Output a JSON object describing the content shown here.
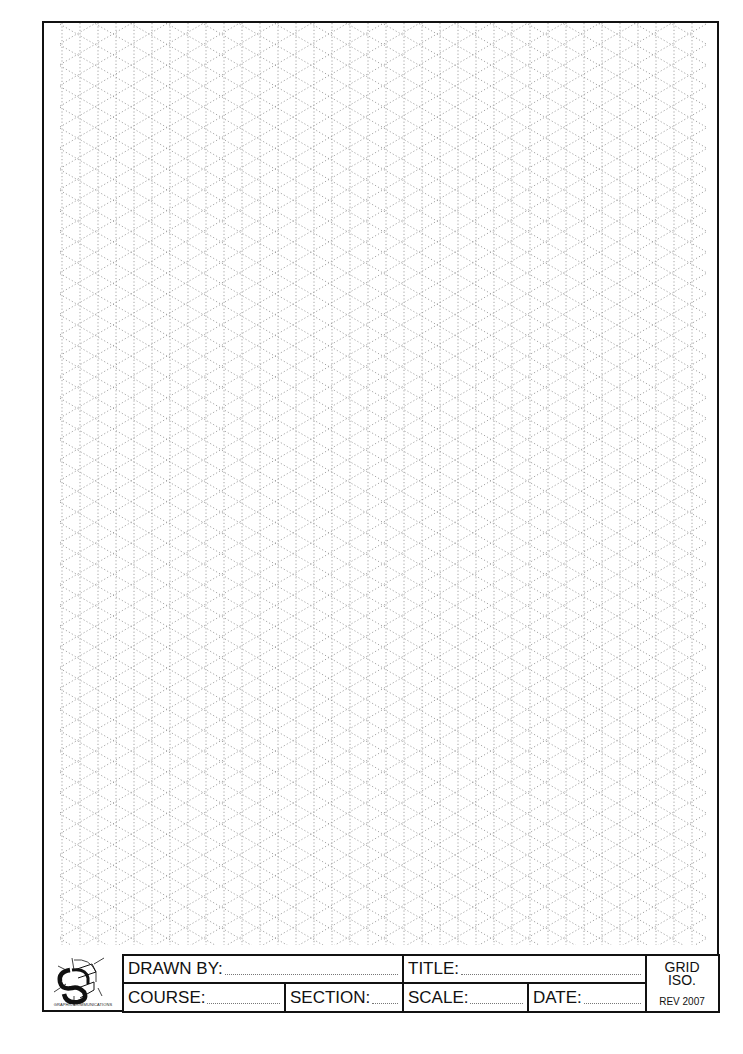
{
  "sheet": {
    "type": "isometric grid paper",
    "grid": {
      "vertical_spacing_px": 18,
      "diagonal_angle_deg": 30,
      "line_style": "dotted",
      "line_color": "#9a9a9a"
    }
  },
  "logo": {
    "caption": "GRAPHIC COMMUNICATIONS"
  },
  "title_block": {
    "drawn_by": "DRAWN BY:",
    "title": "TITLE:",
    "course": "COURSE:",
    "section": "SECTION:",
    "scale": "SCALE:",
    "date": "DATE:",
    "grid_label": "GRID",
    "grid_type": "ISO.",
    "revision": "REV 2007"
  }
}
